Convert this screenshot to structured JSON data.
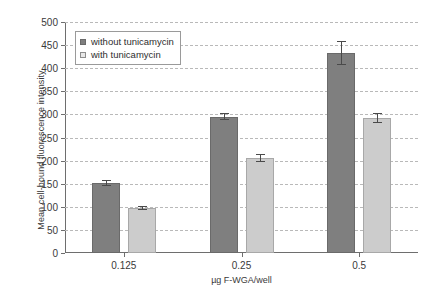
{
  "chart_data": {
    "type": "bar",
    "title": "",
    "xlabel": "µg F-WGA/well",
    "ylabel": "Mean cell-bound fluorescence intensity",
    "categories": [
      "0.125",
      "0.25",
      "0.5"
    ],
    "ylim": [
      0,
      500
    ],
    "yticks": [
      0,
      50,
      100,
      150,
      200,
      250,
      300,
      350,
      400,
      450,
      500
    ],
    "grid": true,
    "legend_position": "top-left",
    "series": [
      {
        "name": "without tunicamycin",
        "color": "#7f7f7f",
        "values": [
          152,
          295,
          432
        ],
        "errors": [
          7,
          7,
          26
        ]
      },
      {
        "name": "with tunicamycin",
        "color": "#cccccc",
        "values": [
          97,
          205,
          292
        ],
        "errors": [
          5,
          9,
          11
        ]
      }
    ]
  },
  "legend": {
    "items": [
      {
        "label": "without tunicamycin",
        "marker": "filled-square-dark"
      },
      {
        "label": "with tunicamycin",
        "marker": "open-square-light"
      }
    ]
  },
  "axes": {
    "y_title": "Mean cell-bound fluorescence intensity",
    "x_title": "µg F-WGA/well",
    "y_tick_labels": [
      "0",
      "50",
      "100",
      "150",
      "200",
      "250",
      "300",
      "350",
      "400",
      "450",
      "500"
    ],
    "x_tick_labels": [
      "0.125",
      "0.25",
      "0.5"
    ]
  }
}
